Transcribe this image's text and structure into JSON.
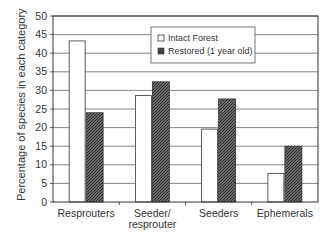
{
  "chart_data": {
    "type": "bar",
    "title": "",
    "xlabel": "",
    "ylabel": "Percentage of species in each category",
    "ylim": [
      0,
      50
    ],
    "yticks": [
      0,
      5,
      10,
      15,
      20,
      25,
      30,
      35,
      40,
      45,
      50
    ],
    "grid": true,
    "legend_position": "upper center (inside plot)",
    "categories": [
      "Resprouters",
      "Seeder/\nresprouter",
      "Seeders",
      "Ephemerals"
    ],
    "category_lines": [
      [
        "Resprouters"
      ],
      [
        "Seeder/",
        "resprouter"
      ],
      [
        "Seeders"
      ],
      [
        "Ephemerals"
      ]
    ],
    "series": [
      {
        "name": "Intact Forest",
        "fill": "white",
        "values": [
          43.3,
          28.6,
          19.6,
          7.7
        ]
      },
      {
        "name": "Restored (1 year old)",
        "fill": "dark hatched",
        "values": [
          24.0,
          32.3,
          27.7,
          15.0
        ]
      }
    ]
  },
  "colors": {
    "axis": "#333333",
    "grid": "#555555",
    "intact_fill": "#ffffff",
    "restored_fill": "#555555"
  }
}
